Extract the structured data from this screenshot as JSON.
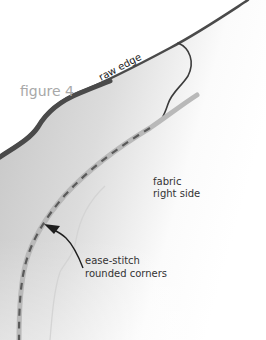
{
  "figure": {
    "title": "figure 4",
    "labels": {
      "raw_edge": "raw edge",
      "fabric_line1": "fabric",
      "fabric_line2": "right side",
      "callout_line1": "ease-stitch",
      "callout_line2": "rounded corners"
    },
    "colors": {
      "background": "#ffffff",
      "fabric_dark": "#c4c4c4",
      "fabric_light": "#ffffff",
      "raw_edge_stroke": "#4a4a4a",
      "stitch_band": "#b9b9b9",
      "stitch_dash": "#5a5a5a",
      "title_text": "#a8a8a8",
      "label_text": "#333333",
      "faint_line": "#d0d0d0"
    }
  }
}
